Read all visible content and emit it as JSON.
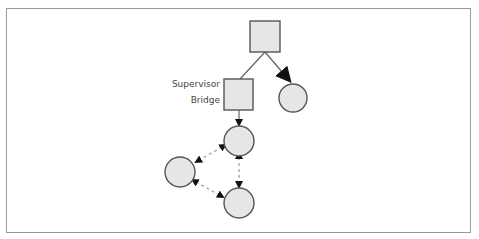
{
  "diagram": {
    "colors": {
      "node_fill": "#e6e6e6",
      "node_stroke": "#555555",
      "edge_solid": "#666666",
      "edge_dashed": "#999999",
      "arrowhead": "#111111",
      "frame": "#9a9a9a"
    },
    "nodes": [
      {
        "id": "top-supervisor",
        "shape": "square"
      },
      {
        "id": "supervisor-bridge",
        "shape": "square",
        "label_lines": [
          "Supervisor",
          "Bridge"
        ]
      },
      {
        "id": "right-worker",
        "shape": "circle"
      },
      {
        "id": "middle-worker",
        "shape": "circle"
      },
      {
        "id": "left-worker",
        "shape": "circle"
      },
      {
        "id": "bottom-worker",
        "shape": "circle"
      }
    ],
    "edges": [
      {
        "from": "top-supervisor",
        "to": "supervisor-bridge",
        "style": "solid",
        "arrow": "none"
      },
      {
        "from": "top-supervisor",
        "to": "right-worker",
        "style": "solid",
        "arrow": "large-end"
      },
      {
        "from": "supervisor-bridge",
        "to": "middle-worker",
        "style": "solid",
        "arrow": "end"
      },
      {
        "from": "middle-worker",
        "to": "left-worker",
        "style": "dashed",
        "arrow": "both"
      },
      {
        "from": "left-worker",
        "to": "bottom-worker",
        "style": "dashed",
        "arrow": "both"
      },
      {
        "from": "middle-worker",
        "to": "bottom-worker",
        "style": "dashed",
        "arrow": "both"
      }
    ],
    "bridge_label": {
      "line1": "Supervisor",
      "line2": "Bridge"
    }
  }
}
